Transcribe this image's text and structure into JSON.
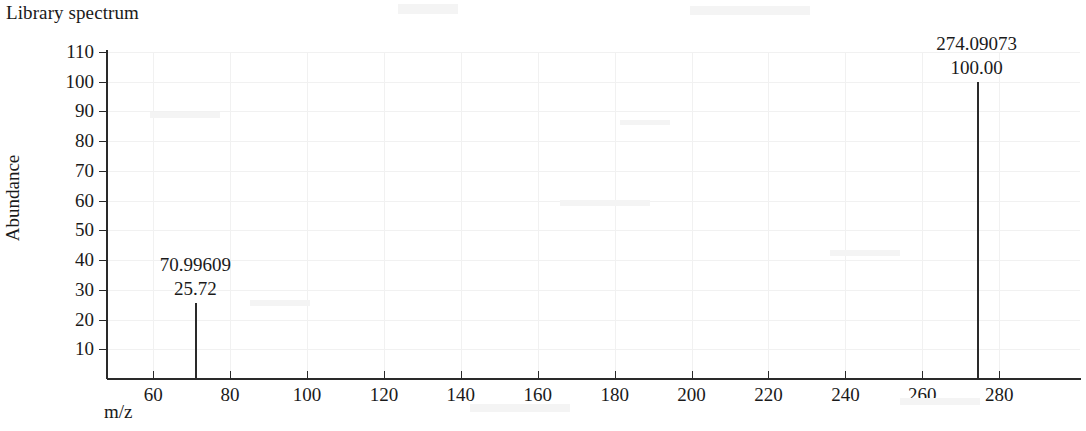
{
  "chart_data": {
    "type": "bar",
    "title": "Library spectrum",
    "xlabel": "m/z",
    "ylabel": "Abundance",
    "xlim": [
      48,
      301
    ],
    "ylim": [
      0,
      115
    ],
    "grid": true,
    "legend": null,
    "x_ticks": [
      60,
      80,
      100,
      120,
      140,
      160,
      180,
      200,
      220,
      240,
      260,
      280
    ],
    "x_tick_labels": [
      "60",
      "80",
      "100",
      "120",
      "140",
      "160",
      "180",
      "200",
      "220",
      "240",
      "260",
      "280"
    ],
    "y_ticks": [
      10,
      20,
      30,
      40,
      50,
      60,
      70,
      80,
      90,
      100,
      110
    ],
    "y_tick_labels": [
      "10",
      "20",
      "30",
      "40",
      "50",
      "60",
      "70",
      "80",
      "90",
      "100",
      "110"
    ],
    "x": [
      70.99609,
      274.09073
    ],
    "values": [
      25.72,
      100.0
    ],
    "peaks": [
      {
        "mz": 70.99609,
        "intensity": 25.72,
        "mz_label": "70.99609",
        "intensity_label": "25.72"
      },
      {
        "mz": 274.09073,
        "intensity": 100.0,
        "mz_label": "274.09073",
        "intensity_label": "100.00"
      }
    ],
    "colors": {
      "peak": "#2a2a2a",
      "axis": "#2a2a2a",
      "grid": "#f1f1f1",
      "text": "#1a1a1a",
      "background": "#ffffff"
    }
  }
}
